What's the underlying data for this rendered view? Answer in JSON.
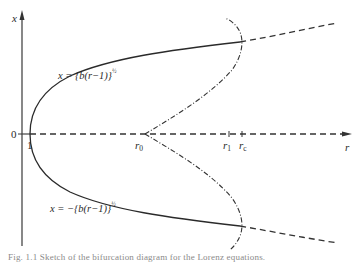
{
  "diagram": {
    "axes": {
      "vertical_label": "x",
      "horizontal_label": "r",
      "origin_label": "0",
      "r_one_label": "1"
    },
    "markers": {
      "r0": {
        "base": "r",
        "sub": "0"
      },
      "r1": {
        "base": "r",
        "sub": "1"
      },
      "rc": {
        "base": "r",
        "sub": "c"
      }
    },
    "branches": {
      "upper": {
        "lhs": "x = ",
        "body": "{b(r−1)}",
        "exp": "½"
      },
      "lower": {
        "lhs": "x = −",
        "body": "{b(r−1)}",
        "exp": "½"
      }
    },
    "legend_styles": {
      "stable": "solid",
      "unstable": "dashed",
      "periodic_orbit_envelope": "dash-dot"
    },
    "colors": {
      "line": "#2a2a2a",
      "axis": "#555555",
      "background": "#ffffff"
    },
    "caption": "Fig. 1.1 Sketch of the bifurcation diagram for the Lorenz equations."
  }
}
